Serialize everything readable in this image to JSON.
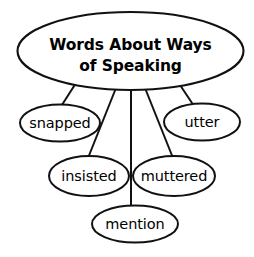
{
  "diagram": {
    "type": "word-web",
    "title_node": {
      "id": "main",
      "lines": [
        "Words About Ways",
        "of Speaking"
      ],
      "text": "Words About Ways of Speaking",
      "bold": true
    },
    "nodes": [
      {
        "id": "snapped",
        "label": "snapped"
      },
      {
        "id": "utter",
        "label": "utter"
      },
      {
        "id": "insisted",
        "label": "insisted"
      },
      {
        "id": "muttered",
        "label": "muttered"
      },
      {
        "id": "mention",
        "label": "mention"
      }
    ],
    "edges": [
      {
        "from": "main",
        "to": "snapped"
      },
      {
        "from": "main",
        "to": "insisted"
      },
      {
        "from": "main",
        "to": "mention"
      },
      {
        "from": "main",
        "to": "muttered"
      },
      {
        "from": "main",
        "to": "utter"
      }
    ],
    "colors": {
      "background": "#ffffff",
      "stroke": "#111111",
      "text": "#000000",
      "fill": "#ffffff"
    }
  }
}
